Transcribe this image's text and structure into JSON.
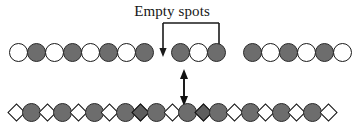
{
  "figure": {
    "caption": "Empty spots",
    "background_color": "#ffffff",
    "outline_color": "#1a1a1a",
    "filled_color": "#6d6d6d",
    "empty_color": "#ffffff",
    "diamond_filled_color": "#5e5e5e"
  },
  "annotations": {
    "bracket": {
      "name": "empty-spots-bracket",
      "description": "bracket with two downward arrows pointing at the two empty spots in the top row"
    },
    "vertical_arrow": {
      "name": "double-headed-vertical-arrow",
      "description": "double-headed vertical arrow linking the top row to the bottom row"
    }
  },
  "rows": {
    "top": {
      "label": "top-lattice-row",
      "y": 43,
      "start_x": 18,
      "pitch": 18,
      "nodes": [
        {
          "shape": "circle",
          "fill": "empty"
        },
        {
          "shape": "circle",
          "fill": "filled"
        },
        {
          "shape": "circle",
          "fill": "empty"
        },
        {
          "shape": "circle",
          "fill": "filled"
        },
        {
          "shape": "circle",
          "fill": "empty"
        },
        {
          "shape": "circle",
          "fill": "filled"
        },
        {
          "shape": "circle",
          "fill": "empty"
        },
        {
          "shape": "circle",
          "fill": "filled"
        },
        {
          "shape": "gap",
          "fill": "none"
        },
        {
          "shape": "circle",
          "fill": "filled"
        },
        {
          "shape": "circle",
          "fill": "empty"
        },
        {
          "shape": "circle",
          "fill": "filled"
        },
        {
          "shape": "gap",
          "fill": "none"
        },
        {
          "shape": "circle",
          "fill": "filled"
        },
        {
          "shape": "circle",
          "fill": "empty"
        },
        {
          "shape": "circle",
          "fill": "filled"
        },
        {
          "shape": "circle",
          "fill": "empty"
        },
        {
          "shape": "circle",
          "fill": "filled"
        },
        {
          "shape": "circle",
          "fill": "empty"
        }
      ]
    },
    "bottom": {
      "label": "bottom-lattice-row",
      "y": 103,
      "start_x": 16,
      "pitch": 15.6,
      "nodes": [
        {
          "shape": "diamond",
          "fill": "empty"
        },
        {
          "shape": "circle",
          "fill": "filled"
        },
        {
          "shape": "diamond",
          "fill": "empty"
        },
        {
          "shape": "circle",
          "fill": "filled"
        },
        {
          "shape": "diamond",
          "fill": "empty"
        },
        {
          "shape": "circle",
          "fill": "filled"
        },
        {
          "shape": "diamond",
          "fill": "empty"
        },
        {
          "shape": "circle",
          "fill": "filled"
        },
        {
          "shape": "diamond",
          "fill": "filled"
        },
        {
          "shape": "circle",
          "fill": "filled"
        },
        {
          "shape": "diamond",
          "fill": "empty"
        },
        {
          "shape": "circle",
          "fill": "filled"
        },
        {
          "shape": "diamond",
          "fill": "filled"
        },
        {
          "shape": "circle",
          "fill": "filled"
        },
        {
          "shape": "diamond",
          "fill": "empty"
        },
        {
          "shape": "circle",
          "fill": "filled"
        },
        {
          "shape": "diamond",
          "fill": "empty"
        },
        {
          "shape": "circle",
          "fill": "filled"
        },
        {
          "shape": "diamond",
          "fill": "empty"
        },
        {
          "shape": "circle",
          "fill": "filled"
        },
        {
          "shape": "diamond",
          "fill": "empty"
        }
      ]
    }
  }
}
